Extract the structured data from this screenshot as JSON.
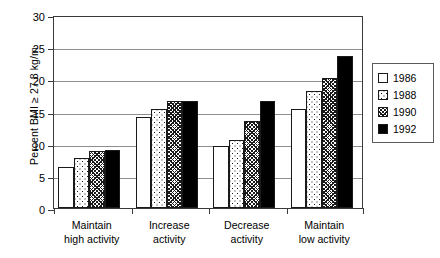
{
  "chart_data": {
    "type": "bar",
    "title": "",
    "xlabel": "",
    "ylabel": "Percent BMI ≥ 27.8 kg/m",
    "ylim": [
      0,
      30
    ],
    "ytick_values": [
      0,
      5,
      10,
      15,
      20,
      25,
      30
    ],
    "ytick_labels": [
      "0",
      "5",
      "10",
      "15",
      "20",
      "25",
      "30"
    ],
    "grid": "horizontal",
    "legend_position": "right",
    "categories": [
      "Maintain high activity",
      "Increase activity",
      "Decrease activity",
      "Maintain low activity"
    ],
    "category_lines": [
      [
        "Maintain",
        "high activity"
      ],
      [
        "Increase",
        "activity"
      ],
      [
        "Decrease",
        "activity"
      ],
      [
        "Maintain",
        "low activity"
      ]
    ],
    "series": [
      {
        "name": "1986",
        "pattern": "solid-white",
        "values": [
          6.3,
          14.1,
          9.6,
          15.4
        ]
      },
      {
        "name": "1988",
        "pattern": "dotted",
        "values": [
          7.8,
          15.4,
          10.5,
          18.2
        ]
      },
      {
        "name": "1990",
        "pattern": "hatched",
        "values": [
          8.8,
          16.6,
          13.6,
          20.2
        ]
      },
      {
        "name": "1992",
        "pattern": "solid-black",
        "values": [
          9.0,
          16.7,
          16.7,
          23.6
        ]
      }
    ]
  },
  "legend": {
    "entries": [
      {
        "label": "1986"
      },
      {
        "label": "1988"
      },
      {
        "label": "1990"
      },
      {
        "label": "1992"
      }
    ]
  },
  "colors": {
    "axis": "#3a3a3a",
    "grid": "#8d8d8d",
    "bar_outline": "#1a1a1a",
    "fill_black": "#000000",
    "fill_white": "#ffffff",
    "background": "#ffffff"
  }
}
